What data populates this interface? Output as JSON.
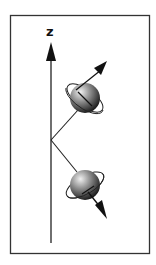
{
  "diagram": {
    "axis_label": "z",
    "colors": {
      "frame": "#333333",
      "line": "#222222",
      "sphere_light": "#e8e8e8",
      "sphere_dark": "#1a1a1a"
    },
    "particles": [
      {
        "name": "upper",
        "spin": "up"
      },
      {
        "name": "lower",
        "spin": "down"
      }
    ]
  }
}
